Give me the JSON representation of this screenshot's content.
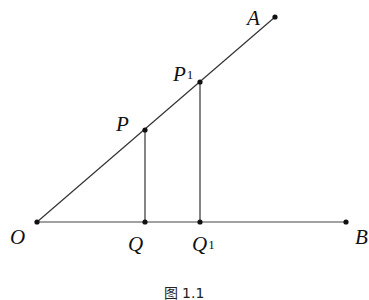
{
  "figure": {
    "caption": "图 1.1",
    "points": {
      "O": {
        "label": "O",
        "x": 37,
        "y": 222
      },
      "P": {
        "label": "P",
        "x": 145,
        "y": 130
      },
      "P1": {
        "label": "P",
        "sub": "1",
        "x": 200,
        "y": 82
      },
      "A": {
        "label": "A",
        "x": 275,
        "y": 17
      },
      "Q": {
        "label": "Q",
        "x": 145,
        "y": 222
      },
      "Q1": {
        "label": "Q",
        "sub": "1",
        "x": 200,
        "y": 222
      },
      "B": {
        "label": "B",
        "x": 346,
        "y": 222
      }
    },
    "segments": [
      [
        "O",
        "A"
      ],
      [
        "O",
        "B"
      ],
      [
        "P",
        "Q"
      ],
      [
        "P1",
        "Q1"
      ]
    ],
    "colors": {
      "line": "#333333",
      "point": "#111111",
      "text": "#111111"
    }
  }
}
